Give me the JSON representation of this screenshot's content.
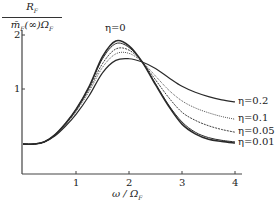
{
  "chart_data": {
    "type": "line",
    "title": "",
    "xlabel": "ω / Ω_F",
    "ylabel": "R_F / (m̄_F(∞) Ω_F)",
    "xlim": [
      0,
      4.2
    ],
    "ylim": [
      -0.55,
      2.05
    ],
    "xticks": [
      1,
      2,
      3,
      4
    ],
    "yticks": [
      1,
      2
    ],
    "grid": false,
    "legend_position": "inline labels at right end of curves",
    "series": [
      {
        "name": "η=0",
        "x": [
          0,
          0.2,
          0.4,
          0.6,
          0.8,
          1.0,
          1.25,
          1.5,
          1.75,
          2.0,
          2.25,
          2.5,
          2.75,
          3.0,
          3.25,
          3.5,
          3.75,
          4.0
        ],
        "values": [
          -0.02,
          -0.02,
          0.02,
          0.15,
          0.36,
          0.62,
          1.05,
          1.6,
          1.89,
          1.8,
          1.5,
          1.08,
          0.68,
          0.35,
          0.17,
          0.07,
          0.03,
          0.0
        ]
      },
      {
        "name": "η=0.01",
        "x": [
          0,
          0.2,
          0.4,
          0.6,
          0.8,
          1.0,
          1.25,
          1.5,
          1.75,
          2.0,
          2.25,
          2.5,
          2.75,
          3.0,
          3.25,
          3.5,
          3.75,
          4.0
        ],
        "values": [
          -0.02,
          -0.02,
          0.02,
          0.15,
          0.36,
          0.62,
          1.04,
          1.56,
          1.84,
          1.77,
          1.5,
          1.1,
          0.7,
          0.39,
          0.2,
          0.1,
          0.05,
          0.02
        ]
      },
      {
        "name": "η=0.05",
        "x": [
          0,
          0.2,
          0.4,
          0.6,
          0.8,
          1.0,
          1.25,
          1.5,
          1.75,
          2.0,
          2.25,
          2.5,
          2.75,
          3.0,
          3.25,
          3.5,
          3.75,
          4.0
        ],
        "values": [
          -0.02,
          -0.02,
          0.02,
          0.15,
          0.35,
          0.6,
          1.0,
          1.47,
          1.74,
          1.72,
          1.5,
          1.17,
          0.84,
          0.57,
          0.42,
          0.32,
          0.25,
          0.2
        ]
      },
      {
        "name": "η=0.1",
        "x": [
          0,
          0.2,
          0.4,
          0.6,
          0.8,
          1.0,
          1.25,
          1.5,
          1.75,
          2.0,
          2.25,
          2.5,
          2.75,
          3.0,
          3.25,
          3.5,
          3.75,
          4.0
        ],
        "values": [
          -0.02,
          -0.02,
          0.02,
          0.14,
          0.34,
          0.58,
          0.96,
          1.4,
          1.65,
          1.66,
          1.5,
          1.24,
          0.98,
          0.78,
          0.65,
          0.56,
          0.49,
          0.44
        ]
      },
      {
        "name": "η=0.2",
        "x": [
          0,
          0.2,
          0.4,
          0.6,
          0.8,
          1.0,
          1.25,
          1.5,
          1.75,
          2.0,
          2.25,
          2.5,
          2.75,
          3.0,
          3.25,
          3.5,
          3.75,
          4.0
        ],
        "values": [
          -0.02,
          -0.02,
          0.02,
          0.13,
          0.31,
          0.53,
          0.88,
          1.3,
          1.53,
          1.56,
          1.5,
          1.38,
          1.21,
          1.05,
          0.94,
          0.86,
          0.8,
          0.76
        ]
      }
    ],
    "annotations": [
      {
        "text": "η=0",
        "near": "peak of η=0 curve"
      }
    ]
  },
  "labels": {
    "y_num": "R",
    "y_num_sub": "F",
    "y_den_pre": "m̄",
    "y_den_sub1": "F",
    "y_den_mid": "(∞)Ω",
    "y_den_sub2": "F",
    "x_main": "ω / Ω",
    "x_sub": "F",
    "xtick_1": "1",
    "xtick_2": "2",
    "xtick_3": "3",
    "xtick_4": "4",
    "ytick_1": "1",
    "ytick_2": "2",
    "eta0": "η=0",
    "eta02": "η=0.2",
    "eta01": "η=0.1",
    "eta005": "η=0.05",
    "eta001": "η=0.01"
  }
}
